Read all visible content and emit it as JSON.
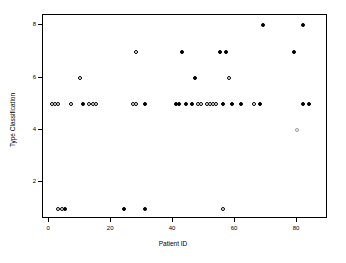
{
  "chart_data": {
    "type": "scatter",
    "title": "",
    "xlabel": "Patient ID",
    "ylabel": "Type Classification",
    "xlim": [
      -2,
      90
    ],
    "ylim": [
      0.6,
      8.4
    ],
    "xticks": [
      0,
      20,
      40,
      60,
      80
    ],
    "yticks": [
      2,
      4,
      6,
      8
    ],
    "grid": false,
    "legend": null,
    "series": [
      {
        "name": "filled",
        "marker": "filled-circle",
        "color": "#000000",
        "points": [
          {
            "x": 5,
            "y": 1
          },
          {
            "x": 24,
            "y": 1
          },
          {
            "x": 31,
            "y": 1
          },
          {
            "x": 41,
            "y": 5
          },
          {
            "x": 42,
            "y": 5
          },
          {
            "x": 44,
            "y": 5
          },
          {
            "x": 46,
            "y": 5
          },
          {
            "x": 56,
            "y": 5
          },
          {
            "x": 59,
            "y": 5
          },
          {
            "x": 62,
            "y": 5
          },
          {
            "x": 68,
            "y": 5
          },
          {
            "x": 82,
            "y": 5
          },
          {
            "x": 84,
            "y": 5
          },
          {
            "x": 11,
            "y": 5
          },
          {
            "x": 31,
            "y": 5
          },
          {
            "x": 47,
            "y": 6
          },
          {
            "x": 43,
            "y": 7
          },
          {
            "x": 55,
            "y": 7
          },
          {
            "x": 57,
            "y": 7
          },
          {
            "x": 79,
            "y": 7
          },
          {
            "x": 69,
            "y": 8
          },
          {
            "x": 82,
            "y": 8
          }
        ]
      },
      {
        "name": "open",
        "marker": "open-circle",
        "color": "#000000",
        "points": [
          {
            "x": 3,
            "y": 1
          },
          {
            "x": 4,
            "y": 1
          },
          {
            "x": 56,
            "y": 1
          },
          {
            "x": 1,
            "y": 5
          },
          {
            "x": 2,
            "y": 5
          },
          {
            "x": 3,
            "y": 5
          },
          {
            "x": 7,
            "y": 5
          },
          {
            "x": 13,
            "y": 5
          },
          {
            "x": 14,
            "y": 5
          },
          {
            "x": 15,
            "y": 5
          },
          {
            "x": 27,
            "y": 5
          },
          {
            "x": 28,
            "y": 5
          },
          {
            "x": 48,
            "y": 5
          },
          {
            "x": 49,
            "y": 5
          },
          {
            "x": 51,
            "y": 5
          },
          {
            "x": 52,
            "y": 5
          },
          {
            "x": 53,
            "y": 5
          },
          {
            "x": 54,
            "y": 5
          },
          {
            "x": 66,
            "y": 5
          },
          {
            "x": 10,
            "y": 6
          },
          {
            "x": 58,
            "y": 6
          },
          {
            "x": 28,
            "y": 7
          }
        ]
      },
      {
        "name": "faint",
        "marker": "open-circle-light",
        "color": "#9a9a9a",
        "points": [
          {
            "x": 80,
            "y": 4
          }
        ]
      }
    ]
  },
  "axes": {
    "x_tick_labels": [
      "0",
      "20",
      "40",
      "60",
      "80"
    ],
    "y_tick_labels": [
      "8",
      "6",
      "4",
      "2"
    ],
    "x_title": "Patient ID",
    "y_title": "Type Classification"
  }
}
